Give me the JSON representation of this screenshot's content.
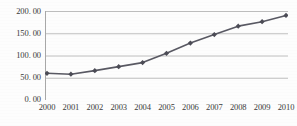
{
  "chart_data": {
    "type": "line",
    "title": "",
    "xlabel": "",
    "ylabel": "",
    "categories": [
      "2000",
      "2001",
      "2002",
      "2003",
      "2004",
      "2005",
      "2006",
      "2007",
      "2008",
      "2009",
      "2010"
    ],
    "values": [
      60.0,
      58.0,
      66.0,
      75.0,
      84.0,
      105.0,
      128.0,
      147.0,
      166.0,
      176.0,
      190.0
    ],
    "series": [
      {
        "name": "",
        "values": [
          60.0,
          58.0,
          66.0,
          75.0,
          84.0,
          105.0,
          128.0,
          147.0,
          166.0,
          176.0,
          190.0
        ]
      }
    ],
    "ylim": [
      0,
      200
    ],
    "y_ticks": [
      0,
      50,
      100,
      150,
      200
    ],
    "y_tick_labels": [
      "0. 00",
      "50. 00",
      "100. 00",
      "150. 00",
      "200. 00"
    ],
    "x_tick_labels": [
      "2000",
      "2001",
      "2002",
      "2003",
      "2004",
      "2005",
      "2006",
      "2007",
      "2008",
      "2009",
      "2010"
    ],
    "grid": true,
    "grid_axis": "y",
    "legend": false,
    "legend_position": "none",
    "marker": "diamond",
    "colors": {
      "series_line": "#595963",
      "marker": "#4c4c56",
      "gridline": "#bfbfbf",
      "axis": "#a8a8a8",
      "text": "#3a3a3a",
      "background": "#fdfdfd"
    }
  }
}
